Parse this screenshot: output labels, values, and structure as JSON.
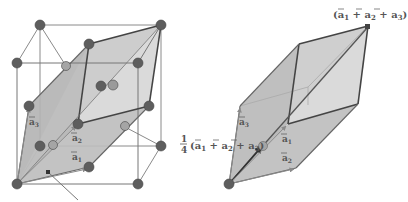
{
  "figure": {
    "left_panel": {
      "name": "fcc-conventional-cell-with-primitive-rhombohedron",
      "labels": {
        "a1": "a",
        "a1_sub": "1",
        "a2": "a",
        "a2_sub": "2",
        "a3": "a",
        "a3_sub": "3"
      }
    },
    "right_panel": {
      "name": "primitive-rhombohedral-cell",
      "top_label": {
        "open": "(",
        "a": "a",
        "s1": "1",
        "plus": " + ",
        "s2": "2",
        "s3": "3",
        "close": ")"
      },
      "mid_label": {
        "frac_num": "1",
        "frac_den": "4",
        "open": "(",
        "s1": "1",
        "s2": "2",
        "s3": "3",
        "close": ")"
      },
      "labels": {
        "a1_sub": "1",
        "a2_sub": "2",
        "a3_sub": "3"
      }
    },
    "colors": {
      "atom_dark": "#5a5a5a",
      "atom_light": "#9a9a9a",
      "face_fill": "#b9b9b9",
      "face_fill_light": "#d6d6d6",
      "edge_dark": "#444444",
      "cube_line": "#777777",
      "label": "#555555"
    }
  }
}
